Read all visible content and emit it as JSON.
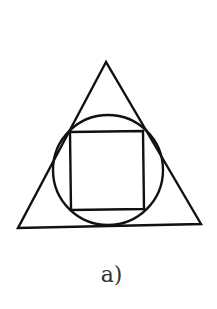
{
  "figure": {
    "caption": "a)",
    "stroke_color": "#111111",
    "stroke_width": 2.4,
    "triangle": {
      "points": [
        [
          106,
          62
        ],
        [
          18,
          228
        ],
        [
          201,
          224
        ]
      ]
    },
    "circle": {
      "cx": 108,
      "cy": 170,
      "r": 55
    },
    "square": {
      "points": [
        [
          70,
          132
        ],
        [
          143,
          131
        ],
        [
          144,
          209
        ],
        [
          71,
          210
        ]
      ]
    }
  }
}
